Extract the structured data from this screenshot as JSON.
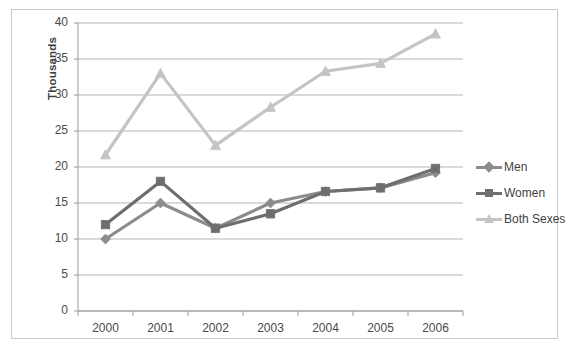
{
  "chart_data": {
    "type": "line",
    "title": "",
    "subtitle": "",
    "xlabel": "",
    "ylabel": "Thousands",
    "categories": [
      "2000",
      "2001",
      "2002",
      "2003",
      "2004",
      "2005",
      "2006"
    ],
    "x": [
      2000,
      2001,
      2002,
      2003,
      2004,
      2005,
      2006
    ],
    "ylim": [
      0,
      40
    ],
    "ytick_step": 5,
    "yticks": [
      0,
      5,
      10,
      15,
      20,
      25,
      30,
      35,
      40
    ],
    "ytick_labels": [
      "0",
      "5",
      "10",
      "15",
      "20",
      "25",
      "30",
      "35",
      "40"
    ],
    "grid": "horizontal",
    "legend_position": "right",
    "series": [
      {
        "name": "Men",
        "values": [
          10.0,
          15.0,
          11.5,
          15.0,
          16.6,
          17.1,
          19.2
        ],
        "color": "#8c8c8c",
        "marker": "diamond"
      },
      {
        "name": "Women",
        "values": [
          12.0,
          18.0,
          11.5,
          13.5,
          16.6,
          17.1,
          19.8
        ],
        "color": "#6e6e6e",
        "marker": "square"
      },
      {
        "name": "Both Sexes",
        "values": [
          21.7,
          33.0,
          23.0,
          28.3,
          33.3,
          34.4,
          38.5
        ],
        "color": "#c4c4c4",
        "marker": "triangle"
      }
    ]
  },
  "legend": {
    "entries": [
      {
        "label": "Men"
      },
      {
        "label": "Women"
      },
      {
        "label": "Both Sexes"
      }
    ]
  },
  "axes": {
    "y_title": "Thousands"
  },
  "colors": {
    "men": "#8c8c8c",
    "women": "#6e6e6e",
    "both": "#c4c4c4",
    "gridline": "#b5b5b5",
    "axis": "#9a9a9a",
    "frame_border": "#c9c9c9",
    "tick_text": "#4a4a4a"
  }
}
